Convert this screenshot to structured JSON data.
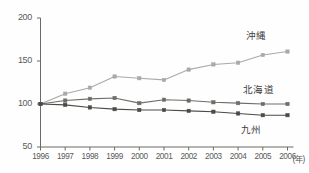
{
  "chart_data": {
    "type": "line",
    "title": "",
    "subtitle": "",
    "xlabel": "(年)",
    "ylabel": "",
    "categories": [
      "1996",
      "1997",
      "1998",
      "1999",
      "2000",
      "2001",
      "2002",
      "2003",
      "2004",
      "2005",
      "2006"
    ],
    "x": [
      1996,
      1997,
      1998,
      1999,
      2000,
      2001,
      2002,
      2003,
      2004,
      2005,
      2006
    ],
    "xlim": [
      1996,
      2006
    ],
    "ylim": [
      50,
      200
    ],
    "yticks": [
      50,
      100,
      150,
      200
    ],
    "ytick_labels": [
      "50",
      "100",
      "150",
      "200"
    ],
    "grid": false,
    "legend_position": "inline-right",
    "series": [
      {
        "name": "沖縄",
        "color": "#a9a9a5",
        "marker": "square",
        "values": [
          100,
          112,
          119,
          132,
          130,
          128,
          140,
          146,
          148,
          157,
          161
        ]
      },
      {
        "name": "北海道",
        "color": "#6e6e68",
        "marker": "square",
        "values": [
          100,
          104,
          106,
          107,
          101,
          105,
          104,
          102,
          101,
          100,
          100
        ]
      },
      {
        "name": "九州",
        "color": "#4a4a46",
        "marker": "square",
        "values": [
          100,
          99,
          96,
          94,
          93,
          93,
          92,
          91,
          89,
          87,
          87
        ]
      }
    ],
    "annotations": [
      {
        "text": "沖縄",
        "series": "沖縄"
      },
      {
        "text": "北海道",
        "series": "北海道"
      },
      {
        "text": "九州",
        "series": "九州"
      }
    ]
  },
  "axis": {
    "x_unit_label": "(年)"
  },
  "colors": {
    "background": "#fefefe",
    "axis": "#6b6b66",
    "tick_text": "#5a5a5a",
    "label_text": "#3c3c3c",
    "series_okinawa": "#a9a9a5",
    "series_hokkaido": "#6e6e68",
    "series_kyushu": "#4a4a46"
  }
}
